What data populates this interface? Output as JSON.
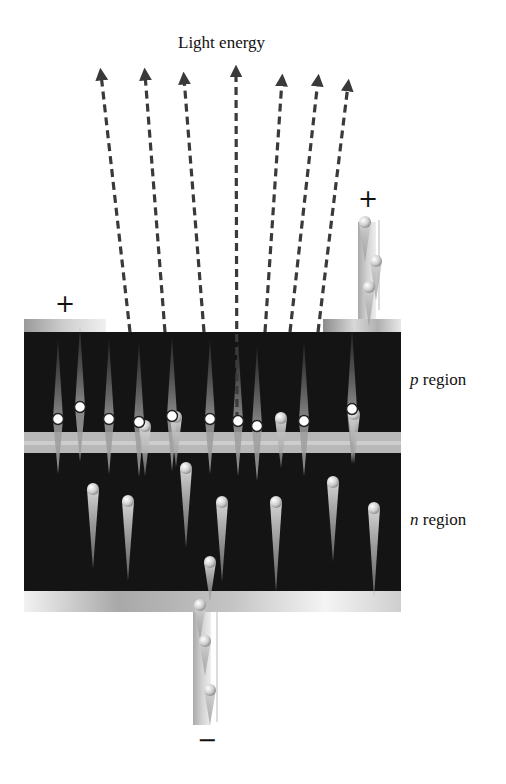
{
  "title": "Light energy",
  "regions": {
    "p": {
      "letter": "p",
      "word": " region"
    },
    "n": {
      "letter": "n",
      "word": " region"
    }
  },
  "terminals": {
    "top_left": "+",
    "top_right": "+",
    "bottom": "−"
  },
  "colors": {
    "semiconductor": "#141414",
    "junction": "#b9b9b9",
    "contact_dark": "#8a8a8a",
    "contact_light": "#e8e8e8",
    "arrow": "#3a3a3a",
    "hole": "#ffffff",
    "electron": "#c9c9c9"
  },
  "light_rays": [
    {
      "x0": 130,
      "y0": 332,
      "x1": 101,
      "y1": 66
    },
    {
      "x0": 165,
      "y0": 332,
      "x1": 145,
      "y1": 66
    },
    {
      "x0": 204,
      "y0": 332,
      "x1": 184,
      "y1": 70
    },
    {
      "x0": 237,
      "y0": 420,
      "x1": 236,
      "y1": 63
    },
    {
      "x0": 265,
      "y0": 332,
      "x1": 282,
      "y1": 72
    },
    {
      "x0": 290,
      "y0": 332,
      "x1": 318,
      "y1": 72
    },
    {
      "x0": 318,
      "y0": 332,
      "x1": 348,
      "y1": 77
    }
  ],
  "holes": [
    {
      "x": 58,
      "y": 419
    },
    {
      "x": 80,
      "y": 407
    },
    {
      "x": 109,
      "y": 419
    },
    {
      "x": 139,
      "y": 422
    },
    {
      "x": 172,
      "y": 416
    },
    {
      "x": 210,
      "y": 419
    },
    {
      "x": 238,
      "y": 421
    },
    {
      "x": 257,
      "y": 426
    },
    {
      "x": 304,
      "y": 421
    },
    {
      "x": 352,
      "y": 409
    }
  ],
  "electrons_n": [
    {
      "x": 93,
      "y": 489,
      "len": 80
    },
    {
      "x": 128,
      "y": 501,
      "len": 80
    },
    {
      "x": 186,
      "y": 468,
      "len": 80
    },
    {
      "x": 222,
      "y": 502,
      "len": 80
    },
    {
      "x": 276,
      "y": 502,
      "len": 90
    },
    {
      "x": 333,
      "y": 482,
      "len": 80
    },
    {
      "x": 374,
      "y": 508,
      "len": 90
    },
    {
      "x": 210,
      "y": 562,
      "len": 40
    }
  ],
  "electrons_junction": [
    {
      "x": 145,
      "y": 426
    },
    {
      "x": 176,
      "y": 417
    },
    {
      "x": 281,
      "y": 418
    },
    {
      "x": 354,
      "y": 414
    }
  ],
  "lead_charges_top": [
    {
      "x": 365,
      "y": 222
    },
    {
      "x": 376,
      "y": 261
    },
    {
      "x": 369,
      "y": 287
    }
  ],
  "lead_charges_bottom": [
    {
      "x": 200,
      "y": 605
    },
    {
      "x": 205,
      "y": 641
    },
    {
      "x": 210,
      "y": 690
    }
  ]
}
